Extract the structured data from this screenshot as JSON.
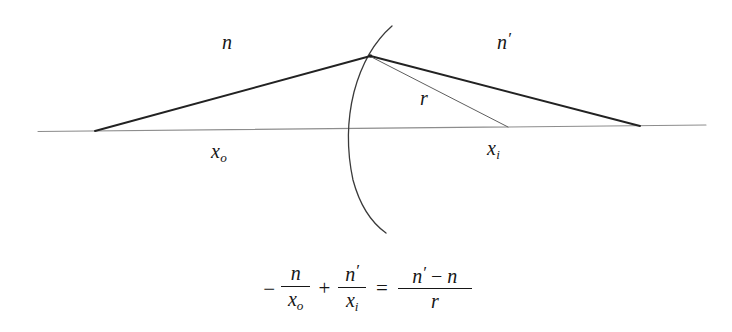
{
  "figure": {
    "background_color": "#ffffff",
    "ink_color": "#161616",
    "axis_color": "#8a8a8a"
  },
  "diagram": {
    "labels": {
      "medium_left": "n",
      "medium_right_base": "n",
      "medium_right_prime": "′",
      "radius": "r",
      "object_distance_base": "x",
      "object_distance_sub": "o",
      "image_distance_base": "x",
      "image_distance_sub": "i"
    },
    "geometry": {
      "optical_axis": {
        "x1": 38,
        "y1": 131,
        "x2": 706,
        "y2": 125
      },
      "object_point": {
        "x": 95,
        "y": 131
      },
      "image_point": {
        "x": 640,
        "y": 126
      },
      "vertex_point": {
        "x": 370,
        "y": 56
      },
      "center_of_curvature": {
        "x": 508,
        "y": 127
      },
      "surface_axis_crossing": {
        "x": 351,
        "y": 128
      },
      "arc_top": {
        "x": 392,
        "y": 26
      },
      "arc_bottom": {
        "x": 386,
        "y": 233
      },
      "incident_ray": {
        "from": "object_point",
        "to": "vertex_point"
      },
      "refracted_ray": {
        "from": "vertex_point",
        "to": "image_point"
      },
      "radius_line": {
        "from": "vertex_point",
        "to": "center_of_curvature"
      }
    }
  },
  "equation": {
    "text": "-n/x_o + n'/x_i = (n' - n)/r",
    "lead_minus": "−",
    "term1": {
      "numerator": "n",
      "denominator_base": "x",
      "denominator_sub": "o"
    },
    "plus": "+",
    "term2": {
      "numerator_base": "n",
      "numerator_prime": "′",
      "denominator_base": "x",
      "denominator_sub": "i"
    },
    "equals": "=",
    "term3": {
      "numerator_first_base": "n",
      "numerator_first_prime": "′",
      "numerator_minus": "−",
      "numerator_second": "n",
      "denominator": "r"
    }
  }
}
